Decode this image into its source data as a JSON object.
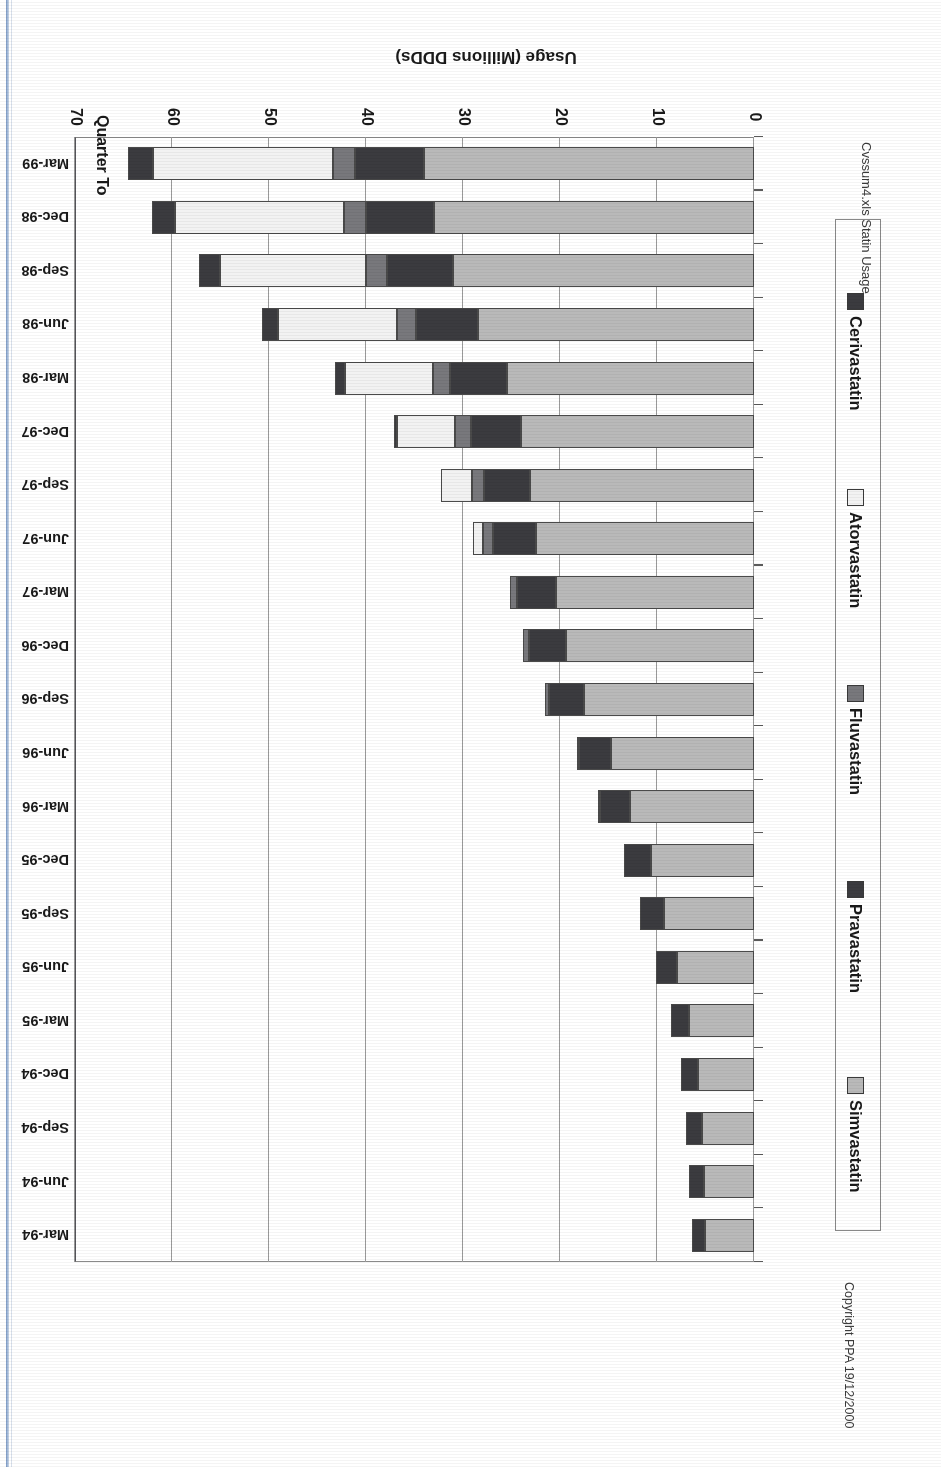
{
  "document": {
    "title": "Trends in Statin Usage (England)",
    "copyright": "Copyright PPA 19/12/2000",
    "source": "Cvssum4.xls Statin Usage"
  },
  "axes": {
    "value_axis_title": "Usage (Millions DDDs)",
    "category_axis_title": "Quarter To",
    "value_ticks": [
      "0",
      "10",
      "20",
      "30",
      "40",
      "50",
      "60",
      "70"
    ]
  },
  "legend": {
    "position": "right",
    "items": [
      {
        "label": "Simvastatin",
        "color": "#b9b9b9"
      },
      {
        "label": "Pravastatin",
        "color": "#3b3b3f"
      },
      {
        "label": "Fluvastatin",
        "color": "#78787c"
      },
      {
        "label": "Atorvastatin",
        "color": "#f2f2f2"
      },
      {
        "label": "Cerivastatin",
        "color": "#3b3b3f"
      }
    ]
  },
  "chart_data": {
    "type": "bar",
    "orientation": "horizontal-stacked",
    "title": "Trends in Statin Usage (England)",
    "xlabel": "Usage (Millions DDDs)",
    "ylabel": "Quarter To",
    "xlim": [
      0,
      70
    ],
    "grid": true,
    "legend_position": "right",
    "categories": [
      "Mar-94",
      "Jun-94",
      "Sep-94",
      "Dec-94",
      "Mar-95",
      "Jun-95",
      "Sep-95",
      "Dec-95",
      "Mar-96",
      "Jun-96",
      "Sep-96",
      "Dec-96",
      "Mar-97",
      "Jun-97",
      "Sep-97",
      "Dec-97",
      "Mar-98",
      "Jun-98",
      "Sep-98",
      "Dec-98",
      "Mar-99"
    ],
    "series": [
      {
        "name": "Simvastatin",
        "color": "#b9b9b9",
        "values": [
          5.0,
          5.2,
          5.4,
          5.8,
          6.7,
          7.9,
          9.3,
          10.6,
          12.8,
          14.7,
          17.5,
          19.4,
          20.4,
          22.5,
          23.1,
          24.0,
          25.5,
          28.5,
          31.0,
          33.0,
          34.0
        ]
      },
      {
        "name": "Pravastatin",
        "color": "#3b3b3f",
        "values": [
          1.4,
          1.5,
          1.6,
          1.7,
          1.9,
          2.2,
          2.5,
          2.8,
          3.1,
          3.3,
          3.6,
          3.8,
          4.0,
          4.4,
          4.7,
          5.2,
          5.8,
          6.3,
          6.8,
          7.0,
          7.1
        ]
      },
      {
        "name": "Fluvastatin",
        "color": "#78787c",
        "values": [
          0,
          0,
          0,
          0,
          0,
          0,
          0,
          0,
          0.1,
          0.2,
          0.4,
          0.6,
          0.8,
          1.0,
          1.3,
          1.6,
          1.8,
          2.0,
          2.2,
          2.3,
          2.3
        ]
      },
      {
        "name": "Atorvastatin",
        "color": "#f2f2f2",
        "values": [
          0,
          0,
          0,
          0,
          0,
          0,
          0,
          0,
          0,
          0,
          0,
          0,
          0,
          1.1,
          3.2,
          6.0,
          9.1,
          12.3,
          15.1,
          17.4,
          18.6
        ]
      },
      {
        "name": "Cerivastatin",
        "color": "#3b3b3f",
        "values": [
          0,
          0,
          0,
          0,
          0,
          0,
          0,
          0,
          0,
          0,
          0,
          0,
          0,
          0,
          0,
          0.3,
          1.0,
          1.6,
          2.1,
          2.4,
          2.5
        ]
      }
    ],
    "totals": [
      6.4,
      6.7,
      7.0,
      7.5,
      8.6,
      10.1,
      11.8,
      13.4,
      16.0,
      18.2,
      21.5,
      23.8,
      25.2,
      29.0,
      32.3,
      37.1,
      43.2,
      50.7,
      57.2,
      62.1,
      64.5
    ]
  }
}
